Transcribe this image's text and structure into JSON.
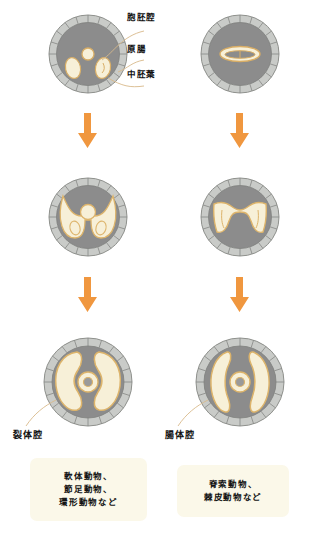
{
  "figure": {
    "title_labels": [
      {
        "id": "blastocoel",
        "text": "胞胚腔"
      },
      {
        "id": "archenteron",
        "text": "原腸"
      },
      {
        "id": "mesoderm",
        "text": "中胚葉"
      }
    ],
    "coelom_labels": [
      {
        "id": "schizocoel",
        "text": "裂体腔"
      },
      {
        "id": "enterocoel",
        "text": "腸体腔"
      }
    ],
    "captions": [
      {
        "id": "protostome",
        "lines": [
          "軟体動物、",
          "節足動物、",
          "環形動物など"
        ]
      },
      {
        "id": "deuterostome",
        "lines": [
          "脊索動物、",
          "棘皮動物など"
        ]
      }
    ],
    "colors": {
      "arrow": "#f0973f",
      "embryo_body": "#8c8c8c",
      "cell_ring": "#c9cbc8",
      "cell_ring_line": "#7d7f7c",
      "cavity_fill": "#f7f0d8",
      "cavity_line": "#e6b96a",
      "caption_bg": "#fbf8e9",
      "leader_line": "#d8b98a",
      "text": "#111111"
    },
    "columns": [
      {
        "id": "left-column",
        "name": "protostome-series"
      },
      {
        "id": "right-column",
        "name": "deuterostome-series"
      }
    ],
    "rows": [
      {
        "id": "row-1",
        "name": "gastrula-stage"
      },
      {
        "id": "row-2",
        "name": "mesoderm-stage"
      },
      {
        "id": "row-3",
        "name": "coelom-stage"
      }
    ],
    "arrows": [
      {
        "id": "arrow-left-1"
      },
      {
        "id": "arrow-right-1"
      },
      {
        "id": "arrow-left-2"
      },
      {
        "id": "arrow-right-2"
      }
    ]
  }
}
